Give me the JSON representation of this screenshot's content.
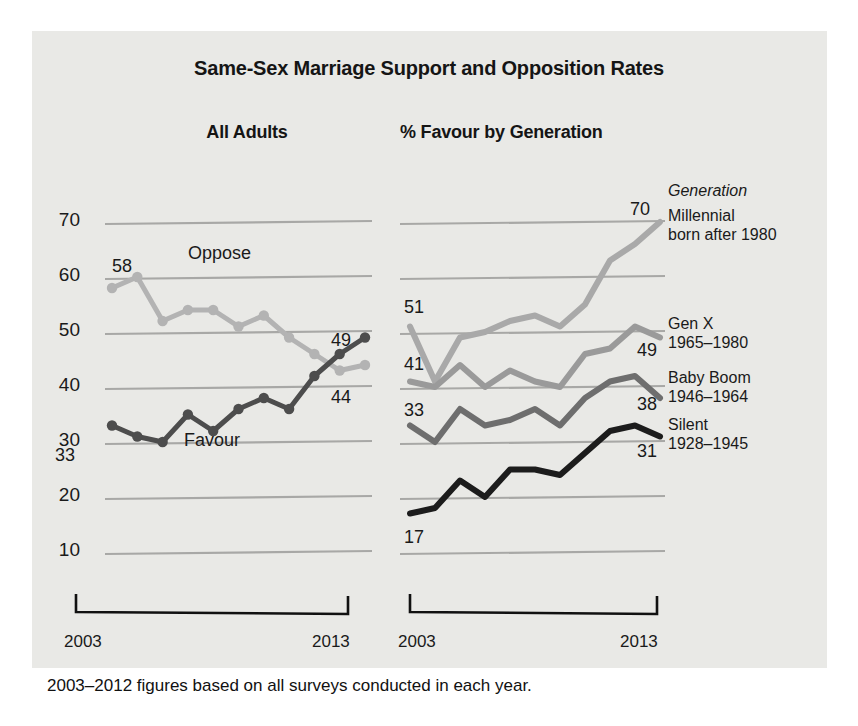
{
  "figure": {
    "title": "Same-Sex Marriage Support and Opposition Rates",
    "footnote": "2003–2012 figures based on all surveys conducted in each year.",
    "panel_color": "#e9e9e6",
    "background": "#ffffff"
  },
  "left_panel": {
    "subtitle": "All Adults",
    "axis_start": "2003",
    "axis_end": "2013",
    "y_ticks": [
      "70",
      "60",
      "50",
      "40",
      "30",
      "20",
      "10"
    ],
    "oppose_label": "Oppose",
    "favour_label": "Favour",
    "oppose_start_label": "58",
    "oppose_end_label": "44",
    "favour_start_label": "33",
    "favour_end_label": "49"
  },
  "right_panel": {
    "subtitle": "% Favour by Generation",
    "axis_start": "2003",
    "axis_end": "2013",
    "legend_header": "Generation",
    "legend": [
      {
        "name": "Millennial",
        "years": "born after 1980",
        "end_label": "70",
        "color": "#a9a9a9"
      },
      {
        "name": "Gen X",
        "years": "1965–1980",
        "end_label": "49",
        "color": "#9a9a9a"
      },
      {
        "name": "Baby Boom",
        "years": "1946–1964",
        "end_label": "38",
        "color": "#6e6e6e"
      },
      {
        "name": "Silent",
        "years": "1928–1945",
        "end_label": "31",
        "color": "#1c1c1c"
      }
    ],
    "start_labels": [
      "51",
      "41",
      "33",
      "17"
    ]
  },
  "chart_data": [
    {
      "type": "line",
      "title": "All Adults",
      "xlabel": "",
      "ylabel": "",
      "x": [
        2003,
        2004,
        2005,
        2006,
        2007,
        2008,
        2009,
        2010,
        2011,
        2012,
        2013
      ],
      "ylim": [
        5,
        72
      ],
      "xlim": [
        2003,
        2013
      ],
      "grid": true,
      "yticks": [
        10,
        20,
        30,
        40,
        50,
        60,
        70
      ],
      "series": [
        {
          "name": "Oppose",
          "color": "#b3b3b3",
          "markers": true,
          "values": [
            58,
            60,
            52,
            54,
            54,
            51,
            53,
            49,
            46,
            43,
            44
          ],
          "start_label": 58,
          "end_label": 44
        },
        {
          "name": "Favour",
          "color": "#4d4d4d",
          "markers": true,
          "values": [
            33,
            31,
            30,
            35,
            32,
            36,
            38,
            36,
            42,
            46,
            49
          ],
          "start_label": 33,
          "end_label": 49
        }
      ]
    },
    {
      "type": "line",
      "title": "% Favour by Generation",
      "xlabel": "",
      "ylabel": "",
      "x": [
        2003,
        2004,
        2005,
        2006,
        2007,
        2008,
        2009,
        2010,
        2011,
        2012,
        2013
      ],
      "ylim": [
        5,
        72
      ],
      "xlim": [
        2003,
        2013
      ],
      "grid": true,
      "yticks": [
        10,
        20,
        30,
        40,
        50,
        60,
        70
      ],
      "series": [
        {
          "name": "Millennial",
          "color": "#a9a9a9",
          "markers": false,
          "values": [
            51,
            41,
            49,
            50,
            52,
            53,
            51,
            55,
            63,
            66,
            70
          ],
          "start_label": 51,
          "end_label": 70
        },
        {
          "name": "Gen X",
          "color": "#9a9a9a",
          "markers": false,
          "values": [
            41,
            40,
            44,
            40,
            43,
            41,
            40,
            46,
            47,
            51,
            49
          ],
          "start_label": 41,
          "end_label": 49
        },
        {
          "name": "Baby Boom",
          "color": "#6e6e6e",
          "markers": false,
          "values": [
            33,
            30,
            36,
            33,
            34,
            36,
            33,
            38,
            41,
            42,
            38
          ],
          "start_label": 33,
          "end_label": 38
        },
        {
          "name": "Silent",
          "color": "#1c1c1c",
          "markers": false,
          "values": [
            17,
            18,
            23,
            20,
            25,
            25,
            24,
            28,
            32,
            33,
            31
          ],
          "start_label": 17,
          "end_label": 31
        }
      ]
    }
  ]
}
